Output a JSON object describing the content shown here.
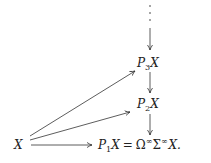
{
  "diagram": {
    "nodes": {
      "x": {
        "base": "X"
      },
      "p3": {
        "base": "P",
        "sub": "3",
        "tail": "X"
      },
      "p2": {
        "base": "P",
        "sub": "2",
        "tail": "X"
      },
      "p1": {
        "base": "P",
        "sub": "1",
        "tail": "X",
        "eq": "=",
        "omega": "Ω",
        "inf1": "∞",
        "sigma": "Σ",
        "inf2": "∞",
        "end": "X."
      }
    },
    "continuation": "⋮",
    "edges": [
      {
        "from": "continuation",
        "to": "p3"
      },
      {
        "from": "p3",
        "to": "p2"
      },
      {
        "from": "p2",
        "to": "p1"
      },
      {
        "from": "x",
        "to": "p3"
      },
      {
        "from": "x",
        "to": "p2"
      },
      {
        "from": "x",
        "to": "p1"
      }
    ]
  }
}
